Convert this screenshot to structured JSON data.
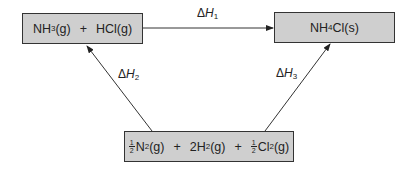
{
  "diagram": {
    "type": "Hess's law enthalpy cycle",
    "nodes": {
      "reactants": {
        "species1": "NH",
        "species1_sub": "3",
        "species1_state": "(g)",
        "plus": "+",
        "species2": "HCl(g)"
      },
      "product": {
        "pre": "NH",
        "sub": "4",
        "post": "Cl(s)"
      },
      "elements": {
        "frac_num": "1",
        "frac_den": "2",
        "s1": "N",
        "s1_sub": "2",
        "s1_state": "(g)",
        "plus1": "+",
        "s2": "2H",
        "s2_sub": "2",
        "s2_state": "(g)",
        "plus2": "+",
        "frac2_num": "1",
        "frac2_den": "2",
        "s3": "Cl",
        "s3_sub": "2",
        "s3_state": "(g)"
      }
    },
    "edges": {
      "dh1": {
        "delta": "Δ",
        "var": "H",
        "sub": "1",
        "from": "NH3(g) + HCl(g)",
        "to": "NH4Cl(s)"
      },
      "dh2": {
        "delta": "Δ",
        "var": "H",
        "sub": "2",
        "from": "½N2(g) + 2H2(g) + ½Cl2(g)",
        "to": "NH3(g) + HCl(g)"
      },
      "dh3": {
        "delta": "Δ",
        "var": "H",
        "sub": "3",
        "from": "½N2(g) + 2H2(g) + ½Cl2(g)",
        "to": "NH4Cl(s)"
      }
    },
    "colors": {
      "box_fill": "#cfcfcf",
      "stroke": "#333333",
      "background": "#ffffff"
    }
  }
}
